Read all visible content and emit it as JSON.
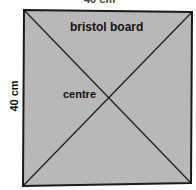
{
  "diagram": {
    "top_dimension_label": "40 cm",
    "side_dimension_label": "40 cm",
    "board_label": "bristol board",
    "centre_label": "centre",
    "colors": {
      "board_fill": "#b8b8b8",
      "line": "#1a1a1a",
      "text": "#111111"
    }
  }
}
